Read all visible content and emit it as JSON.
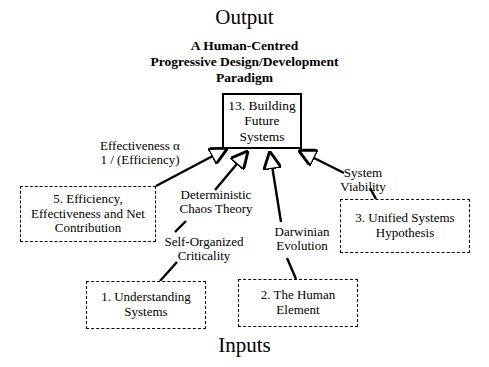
{
  "diagram": {
    "output_heading": "Output",
    "output_subtitle_lines": [
      "A Human-Centred",
      "Progressive Design/Development",
      "Paradigm"
    ],
    "inputs_heading": "Inputs",
    "nodes": {
      "building_future_systems": {
        "number": "13.",
        "lines": [
          "13. Building",
          "Future",
          "Systems"
        ],
        "style": "solid"
      },
      "efficiency_effectiveness": {
        "number": "5.",
        "lines": [
          "5. Efficiency,",
          "Effectiveness and Net",
          "Contribution"
        ],
        "style": "dashed"
      },
      "unified_systems": {
        "number": "3.",
        "lines": [
          "3. Unified Systems",
          "Hypothesis"
        ],
        "style": "dashed"
      },
      "understanding_systems": {
        "number": "1.",
        "lines": [
          "1. Understanding",
          "Systems"
        ],
        "style": "dashed"
      },
      "human_element": {
        "number": "2.",
        "lines": [
          "2. The Human",
          "Element"
        ],
        "style": "dashed"
      }
    },
    "edge_labels": {
      "effectiveness_alpha": [
        "Effectiveness α",
        "1 / (Efficiency)"
      ],
      "deterministic_chaos": [
        "Deterministic",
        "Chaos Theory"
      ],
      "self_organized_criticality": [
        "Self-Organized",
        "Criticality"
      ],
      "darwinian_evolution": [
        "Darwinian",
        "Evolution"
      ],
      "system_viability": [
        "System",
        "Viability"
      ]
    },
    "colors": {
      "ink": "#000000",
      "paper": "#ffffff"
    }
  }
}
